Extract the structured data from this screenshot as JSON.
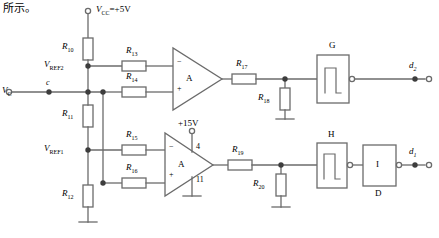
{
  "page": {
    "heading_text": "所示。",
    "background_color": "#ffffff",
    "wire_color": "#6b6b6b",
    "text_color": "#000000"
  },
  "supplies": {
    "vcc": {
      "label": "V",
      "sub": "CC",
      "value": "=+5V",
      "terminal": "open-circle"
    },
    "v15": {
      "label": "+15V",
      "terminal": "open-circle"
    }
  },
  "inputs": {
    "vc": {
      "label": "V",
      "sub": "C",
      "terminal": "open-circle"
    },
    "node_c": {
      "label": "c"
    }
  },
  "references": {
    "vref2": {
      "label": "V",
      "sub": "REF2"
    },
    "vref1": {
      "label": "V",
      "sub": "REF1"
    }
  },
  "resistors": [
    {
      "id": "R10",
      "label": "R",
      "sub": "10",
      "orientation": "vertical"
    },
    {
      "id": "R13",
      "label": "R",
      "sub": "13",
      "orientation": "horizontal"
    },
    {
      "id": "R14",
      "label": "R",
      "sub": "14",
      "orientation": "horizontal"
    },
    {
      "id": "R11",
      "label": "R",
      "sub": "11",
      "orientation": "vertical"
    },
    {
      "id": "R15",
      "label": "R",
      "sub": "15",
      "orientation": "horizontal"
    },
    {
      "id": "R16",
      "label": "R",
      "sub": "16",
      "orientation": "horizontal"
    },
    {
      "id": "R12",
      "label": "R",
      "sub": "12",
      "orientation": "vertical"
    },
    {
      "id": "R17",
      "label": "R",
      "sub": "17",
      "orientation": "horizontal"
    },
    {
      "id": "R18",
      "label": "R",
      "sub": "18",
      "orientation": "vertical"
    },
    {
      "id": "R19",
      "label": "R",
      "sub": "19",
      "orientation": "horizontal"
    },
    {
      "id": "R20",
      "label": "R",
      "sub": "20",
      "orientation": "vertical"
    }
  ],
  "opamps": [
    {
      "id": "A-top",
      "label": "A",
      "inverting_mark": "−",
      "noninverting_mark": "+"
    },
    {
      "id": "A-bottom",
      "label": "A",
      "inverting_mark": "−",
      "noninverting_mark": "+",
      "pin_vcc": "4",
      "pin_gnd": "11"
    }
  ],
  "blocks": [
    {
      "id": "G",
      "label": "G",
      "kind": "schmitt-trigger",
      "output_bubble": true
    },
    {
      "id": "H",
      "label": "H",
      "kind": "schmitt-trigger",
      "output_bubble": true
    },
    {
      "id": "I",
      "label": "I",
      "sublabel": "D",
      "kind": "inverter",
      "output_bubble": true
    }
  ],
  "outputs": [
    {
      "id": "d2",
      "label": "d",
      "sub": "2",
      "terminal": "open-circle"
    },
    {
      "id": "d1",
      "label": "d",
      "sub": "1",
      "terminal": "open-circle"
    }
  ]
}
